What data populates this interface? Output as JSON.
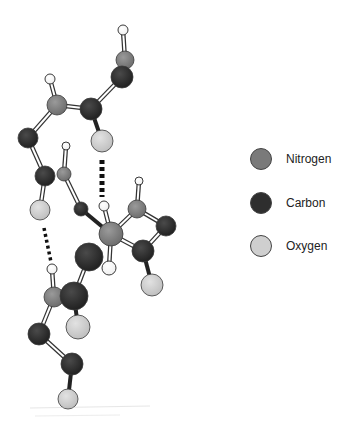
{
  "colors": {
    "nitrogen": "#7a7a7a",
    "carbon": "#2e2e2e",
    "oxygen": "#cfcfcf",
    "hydrogen": "#ffffff",
    "outline": "#3a3a3a",
    "hbond": "#111111"
  },
  "legend": {
    "items": [
      {
        "element": "nitrogen",
        "label": "Nitrogen"
      },
      {
        "element": "carbon",
        "label": "Carbon"
      },
      {
        "element": "oxygen",
        "label": "Oxygen"
      }
    ]
  },
  "molecule": {
    "atoms": [
      {
        "id": "h1",
        "el": "hydrogen",
        "x": 123,
        "y": 30,
        "r": 5
      },
      {
        "id": "n1",
        "el": "nitrogen",
        "x": 125,
        "y": 60,
        "r": 9
      },
      {
        "id": "c1",
        "el": "carbon",
        "x": 122,
        "y": 77,
        "r": 11
      },
      {
        "id": "h2",
        "el": "hydrogen",
        "x": 50,
        "y": 79,
        "r": 5
      },
      {
        "id": "n2",
        "el": "nitrogen",
        "x": 57,
        "y": 105,
        "r": 10
      },
      {
        "id": "c2",
        "el": "carbon",
        "x": 91,
        "y": 109,
        "r": 11
      },
      {
        "id": "o1",
        "el": "oxygen",
        "x": 102,
        "y": 141,
        "r": 11
      },
      {
        "id": "c3",
        "el": "carbon",
        "x": 28,
        "y": 138,
        "r": 10
      },
      {
        "id": "h3",
        "el": "hydrogen",
        "x": 66,
        "y": 146,
        "r": 4
      },
      {
        "id": "c4",
        "el": "carbon",
        "x": 45,
        "y": 176,
        "r": 10
      },
      {
        "id": "n3",
        "el": "nitrogen",
        "x": 64,
        "y": 174,
        "r": 7
      },
      {
        "id": "o2",
        "el": "oxygen",
        "x": 40,
        "y": 210,
        "r": 10
      },
      {
        "id": "c5",
        "el": "carbon",
        "x": 81,
        "y": 209,
        "r": 7
      },
      {
        "id": "h4",
        "el": "hydrogen",
        "x": 104,
        "y": 206,
        "r": 5
      },
      {
        "id": "h5",
        "el": "hydrogen",
        "x": 139,
        "y": 181,
        "r": 4
      },
      {
        "id": "n4",
        "el": "nitrogen",
        "x": 137,
        "y": 209,
        "r": 9
      },
      {
        "id": "c6",
        "el": "carbon",
        "x": 166,
        "y": 226,
        "r": 10
      },
      {
        "id": "c7",
        "el": "carbon",
        "x": 89,
        "y": 257,
        "r": 14
      },
      {
        "id": "n5",
        "el": "nitrogen",
        "x": 111,
        "y": 234,
        "r": 12
      },
      {
        "id": "h6",
        "el": "hydrogen",
        "x": 109,
        "y": 268,
        "r": 7
      },
      {
        "id": "c8",
        "el": "carbon",
        "x": 143,
        "y": 251,
        "r": 11
      },
      {
        "id": "o3",
        "el": "oxygen",
        "x": 152,
        "y": 285,
        "r": 11
      },
      {
        "id": "h7",
        "el": "hydrogen",
        "x": 52,
        "y": 269,
        "r": 5
      },
      {
        "id": "n6",
        "el": "nitrogen",
        "x": 54,
        "y": 297,
        "r": 10
      },
      {
        "id": "c9",
        "el": "carbon",
        "x": 74,
        "y": 296,
        "r": 14
      },
      {
        "id": "o4",
        "el": "oxygen",
        "x": 78,
        "y": 327,
        "r": 12
      },
      {
        "id": "c10",
        "el": "carbon",
        "x": 39,
        "y": 334,
        "r": 11
      },
      {
        "id": "c11",
        "el": "carbon",
        "x": 72,
        "y": 364,
        "r": 11
      },
      {
        "id": "o5",
        "el": "oxygen",
        "x": 68,
        "y": 399,
        "r": 10
      }
    ],
    "bonds": [
      {
        "a": "h1",
        "b": "n1",
        "type": "double"
      },
      {
        "a": "n1",
        "b": "c1",
        "type": "double"
      },
      {
        "a": "c1",
        "b": "c2",
        "type": "double"
      },
      {
        "a": "c2",
        "b": "n2",
        "type": "double"
      },
      {
        "a": "h2",
        "b": "n2",
        "type": "double"
      },
      {
        "a": "c2",
        "b": "o1",
        "type": "single"
      },
      {
        "a": "n2",
        "b": "c3",
        "type": "double"
      },
      {
        "a": "c3",
        "b": "c4",
        "type": "double"
      },
      {
        "a": "c4",
        "b": "o2",
        "type": "double"
      },
      {
        "a": "h3",
        "b": "n3",
        "type": "double"
      },
      {
        "a": "n3",
        "b": "c5",
        "type": "double"
      },
      {
        "a": "c5",
        "b": "n5",
        "type": "single"
      },
      {
        "a": "h4",
        "b": "n5",
        "type": "double"
      },
      {
        "a": "n5",
        "b": "h6",
        "type": "double"
      },
      {
        "a": "n5",
        "b": "n4",
        "type": "double"
      },
      {
        "a": "h5",
        "b": "n4",
        "type": "double"
      },
      {
        "a": "n4",
        "b": "c6",
        "type": "double"
      },
      {
        "a": "c6",
        "b": "c8",
        "type": "double"
      },
      {
        "a": "n5",
        "b": "c8",
        "type": "double"
      },
      {
        "a": "c8",
        "b": "o3",
        "type": "single"
      },
      {
        "a": "c7",
        "b": "c9",
        "type": "double"
      },
      {
        "a": "h7",
        "b": "n6",
        "type": "double"
      },
      {
        "a": "n6",
        "b": "c10",
        "type": "double"
      },
      {
        "a": "c9",
        "b": "o4",
        "type": "single"
      },
      {
        "a": "c10",
        "b": "c11",
        "type": "double"
      },
      {
        "a": "c11",
        "b": "o5",
        "type": "single"
      }
    ],
    "hbonds": [
      {
        "x1": 102,
        "y1": 160,
        "x2": 102,
        "y2": 197,
        "style": "thick"
      },
      {
        "x1": 44,
        "y1": 228,
        "x2": 51,
        "y2": 262,
        "style": "thin"
      }
    ]
  }
}
